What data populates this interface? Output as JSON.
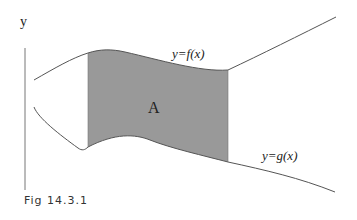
{
  "figure": {
    "axis_label": "y",
    "upper_curve_label": "y=f(x)",
    "lower_curve_label": "y=g(x)",
    "region_label": "A",
    "caption": "Fig 14.3.1"
  },
  "colors": {
    "fill": "#999999",
    "stroke": "#555555",
    "axis": "#777777"
  }
}
